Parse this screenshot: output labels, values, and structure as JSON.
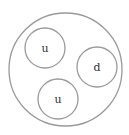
{
  "diagram": {
    "type": "proton-quark-structure",
    "outer": {
      "cx": 65.5,
      "cy": 69.5,
      "r": 56.5
    },
    "quarks": [
      {
        "label": "u",
        "cx": 45,
        "cy": 48,
        "r": 20
      },
      {
        "label": "d",
        "cx": 97,
        "cy": 67,
        "r": 20
      },
      {
        "label": "u",
        "cx": 58,
        "cy": 99,
        "r": 20
      }
    ],
    "colors": {
      "stroke": "#9a9a9a",
      "text": "#333333"
    }
  }
}
